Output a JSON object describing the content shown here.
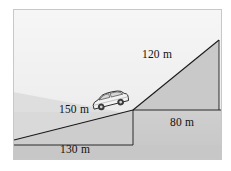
{
  "figure": {
    "frame": {
      "x": 13,
      "y": 9,
      "width": 209,
      "height": 151,
      "border_color": "#c8c8c8"
    },
    "colors": {
      "sky_top": "#f2f2f2",
      "sky_bottom": "#e2e2e2",
      "far_hill": "#dcdcdc",
      "terrain": "#c9c9c9",
      "terrain_light": "#d2d2d2",
      "line": "#1a1a1a",
      "label_text": "#111111",
      "car_body": "#f4f4f4",
      "car_outline": "#2b2b2b",
      "car_window": "#d8d8d8",
      "car_wheel": "#3a3a3a"
    },
    "labels": [
      {
        "name": "downhill-length-label",
        "text": "150 m",
        "x": 74,
        "y": 113
      },
      {
        "name": "horizontal-run-label",
        "text": "130 m",
        "x": 75,
        "y": 153
      },
      {
        "name": "uphill-length-label",
        "text": "120 m",
        "x": 157,
        "y": 58
      },
      {
        "name": "uphill-run-label",
        "text": "80 m",
        "x": 182,
        "y": 126
      }
    ],
    "geometry": {
      "slope_left_start": {
        "x": 14,
        "y": 140
      },
      "valley_vertex": {
        "x": 133,
        "y": 110
      },
      "peak": {
        "x": 219,
        "y": 40
      },
      "peak_base": {
        "x": 219,
        "y": 110
      },
      "baseline_y": 145,
      "baseline_x_start": 14,
      "baseline_x_end": 133,
      "valley_floor_y": 110,
      "right_edge_x": 222
    },
    "car": {
      "name": "car-icon",
      "x": 89,
      "y": 97,
      "width": 38,
      "height": 21,
      "rotation_deg": -14,
      "description": "small light-coloured hatchback SUV travelling down the slope"
    }
  }
}
